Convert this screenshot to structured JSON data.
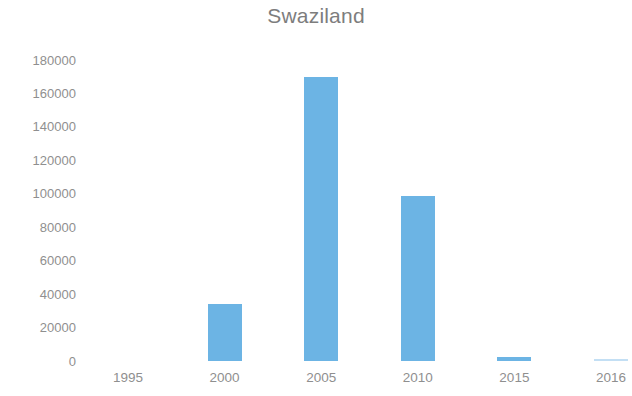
{
  "chart_data": {
    "type": "bar",
    "title": "Swaziland",
    "xlabel": "",
    "ylabel": "",
    "categories": [
      "1995",
      "2000",
      "2005",
      "2010",
      "2015",
      "2016"
    ],
    "values": [
      0,
      34000,
      170000,
      98500,
      2500,
      800
    ],
    "ylim": [
      0,
      180000
    ],
    "yticks": [
      0,
      20000,
      40000,
      60000,
      80000,
      100000,
      120000,
      140000,
      160000,
      180000
    ],
    "ytick_labels": [
      "0",
      "20000",
      "40000",
      "60000",
      "80000",
      "100000",
      "120000",
      "140000",
      "160000",
      "180000"
    ],
    "grid": false,
    "legend": false,
    "series": [
      {
        "name": "Swaziland",
        "values": [
          0,
          34000,
          170000,
          98500,
          2500,
          800
        ]
      }
    ],
    "colors": {
      "bar": "#6cb4e4",
      "bar_faded": "#c3dff4",
      "title_text": "#7d7d7d",
      "tick_text": "#8f8f8f",
      "background": "#ffffff"
    }
  }
}
